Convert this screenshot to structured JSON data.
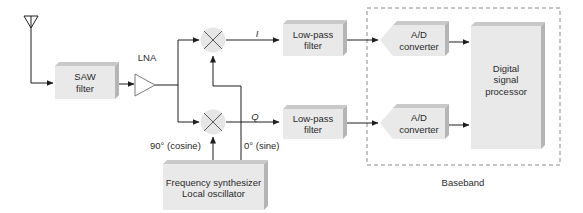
{
  "diagram": {
    "type": "quadrature-receiver-block-diagram",
    "colors": {
      "block_face": "#e9e9e9",
      "block_top": "#c9c9c9",
      "block_side": "#b5b5b5",
      "line": "#1e1e1e",
      "dashed_border": "#8a8a8a",
      "text": "#2a2a2a"
    },
    "nodes": {
      "antenna": {
        "label": ""
      },
      "saw_filter": {
        "line1": "SAW",
        "line2": "filter"
      },
      "lna": {
        "label": "LNA"
      },
      "mixer_i": {
        "label": ""
      },
      "mixer_q": {
        "label": ""
      },
      "lpf_i": {
        "line1": "Low-pass",
        "line2": "filter"
      },
      "lpf_q": {
        "line1": "Low-pass",
        "line2": "filter"
      },
      "adc_i": {
        "line1": "A/D",
        "line2": "converter"
      },
      "adc_q": {
        "line1": "A/D",
        "line2": "converter"
      },
      "dsp": {
        "line1": "Digital",
        "line2": "signal",
        "line3": "processor"
      },
      "synth": {
        "line1": "Frequency synthesizer",
        "line2": "Local oscillator"
      }
    },
    "signal_labels": {
      "i_branch": "I",
      "q_branch": "Q",
      "cosine": "90° (cosine)",
      "sine": "0° (sine)"
    },
    "group": {
      "label": "Baseband"
    },
    "edges": [
      [
        "antenna",
        "saw_filter"
      ],
      [
        "saw_filter",
        "lna"
      ],
      [
        "lna",
        "mixer_i"
      ],
      [
        "lna",
        "mixer_q"
      ],
      [
        "mixer_i",
        "lpf_i"
      ],
      [
        "mixer_q",
        "lpf_q"
      ],
      [
        "lpf_i",
        "adc_i"
      ],
      [
        "lpf_q",
        "adc_q"
      ],
      [
        "adc_i",
        "dsp"
      ],
      [
        "adc_q",
        "dsp"
      ],
      [
        "synth",
        "mixer_i"
      ],
      [
        "synth",
        "mixer_q"
      ]
    ]
  }
}
